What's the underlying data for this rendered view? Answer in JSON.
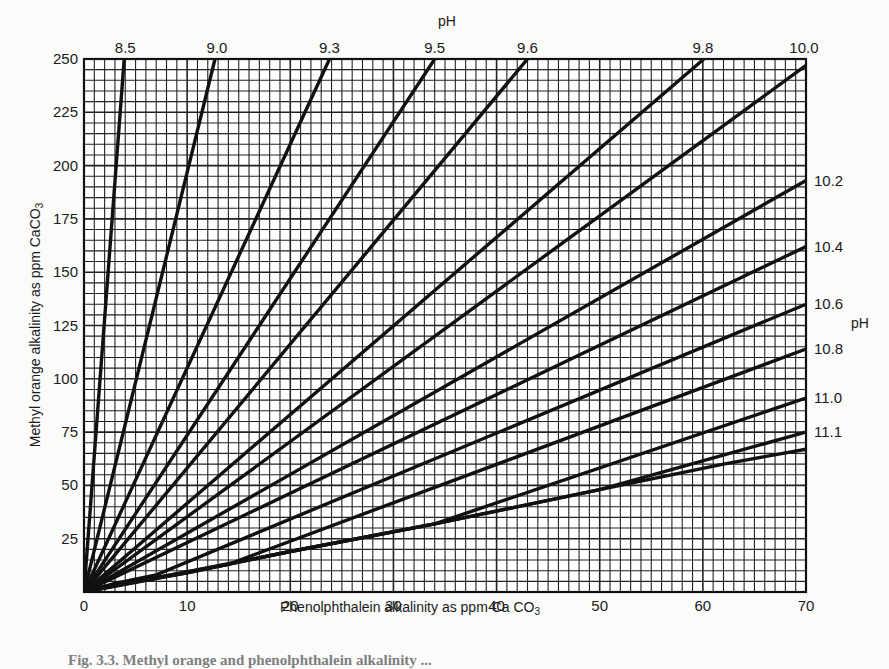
{
  "chart_data": {
    "type": "line",
    "title": "",
    "xlabel": "Phenolphthalein alkalinity as ppm CaCO3",
    "ylabel": "Methyl orange alkalinity as ppm CaCO3",
    "secondary_axis_label_top": "pH",
    "secondary_axis_label_right": "pH",
    "xlim": [
      0,
      70
    ],
    "ylim": [
      0,
      250
    ],
    "x_ticks": [
      0,
      10,
      20,
      30,
      40,
      50,
      60,
      70
    ],
    "y_ticks": [
      25,
      50,
      75,
      100,
      125,
      150,
      175,
      200,
      225,
      250
    ],
    "grid": {
      "on": true,
      "x_minor_step": 1,
      "y_minor_step": 5,
      "x_major_step": 10,
      "y_major_step": 25
    },
    "legend_position": "curve labels at top and right edges",
    "series": [
      {
        "name": "8.5",
        "label_edge": "top",
        "points": [
          [
            0,
            0
          ],
          [
            3.9,
            250
          ]
        ]
      },
      {
        "name": "9.0",
        "label_edge": "top",
        "points": [
          [
            0,
            0
          ],
          [
            12.7,
            250
          ]
        ]
      },
      {
        "name": "9.3",
        "label_edge": "top",
        "points": [
          [
            0,
            0
          ],
          [
            23.8,
            250
          ]
        ]
      },
      {
        "name": "9.5",
        "label_edge": "top",
        "points": [
          [
            0,
            0
          ],
          [
            34.0,
            250
          ]
        ]
      },
      {
        "name": "9.6",
        "label_edge": "top",
        "points": [
          [
            0,
            0
          ],
          [
            43.0,
            250
          ]
        ]
      },
      {
        "name": "9.8",
        "label_edge": "top",
        "points": [
          [
            0,
            0
          ],
          [
            60.1,
            250
          ]
        ]
      },
      {
        "name": "10.0",
        "label_edge": "top",
        "points": [
          [
            0,
            0
          ],
          [
            70,
            247
          ]
        ]
      },
      {
        "name": "10.2",
        "label_edge": "right",
        "points": [
          [
            0,
            0
          ],
          [
            70,
            193
          ]
        ]
      },
      {
        "name": "10.4",
        "label_edge": "right",
        "points": [
          [
            0,
            0
          ],
          [
            70,
            162
          ]
        ]
      },
      {
        "name": "10.6",
        "label_edge": "right",
        "points": [
          [
            0,
            0
          ],
          [
            3,
            4
          ],
          [
            7,
            8
          ],
          [
            70,
            135
          ]
        ]
      },
      {
        "name": "10.8",
        "label_edge": "right",
        "points": [
          [
            0,
            0
          ],
          [
            5,
            5
          ],
          [
            14,
            13
          ],
          [
            70,
            114
          ]
        ]
      },
      {
        "name": "11.0",
        "label_edge": "right",
        "points": [
          [
            0,
            0
          ],
          [
            10,
            9
          ],
          [
            20,
            19
          ],
          [
            34,
            32
          ],
          [
            70,
            91
          ]
        ]
      },
      {
        "name": "11.1",
        "label_edge": "right",
        "points": [
          [
            0,
            0
          ],
          [
            20,
            19
          ],
          [
            34,
            32
          ],
          [
            50,
            48
          ],
          [
            70,
            75
          ]
        ]
      },
      {
        "name": "base",
        "label_edge": "none",
        "points": [
          [
            0,
            0
          ],
          [
            5,
            5
          ],
          [
            10,
            9
          ],
          [
            15,
            14
          ],
          [
            20,
            19
          ],
          [
            34,
            32
          ],
          [
            50,
            48
          ],
          [
            62,
            60
          ],
          [
            70,
            67
          ]
        ]
      }
    ]
  },
  "labels": {
    "top_ph_title": "pH",
    "right_ph_title": "pH",
    "top_curve_labels": [
      {
        "text": "8.5",
        "x": 4.0
      },
      {
        "text": "9.0",
        "x": 12.9
      },
      {
        "text": "9.3",
        "x": 23.8
      },
      {
        "text": "9.5",
        "x": 34.0
      },
      {
        "text": "9.6",
        "x": 43.0
      },
      {
        "text": "9.8",
        "x": 60.0
      },
      {
        "text": "10.0",
        "x": 69.8
      }
    ],
    "right_curve_labels": [
      {
        "text": "10.2",
        "y": 193
      },
      {
        "text": "10.4",
        "y": 162
      },
      {
        "text": "10.6",
        "y": 135
      },
      {
        "text": "10.8",
        "y": 114
      },
      {
        "text": "11.0",
        "y": 91
      },
      {
        "text": "11.1",
        "y": 75
      }
    ],
    "x_axis_title_main": "Phenolphthalein alkalinity as ppm Ca CO",
    "x_axis_title_sub": "3",
    "y_axis_title_main": "Methyl orange alkalinity as ppm CaCO",
    "y_axis_title_sub": "3",
    "caption": "Fig. 3.3. Methyl orange and phenolphthalein alkalinity ..."
  },
  "style": {
    "paper": "#fbfbfa",
    "ink": "#111111",
    "grid_ink": "#222222"
  }
}
